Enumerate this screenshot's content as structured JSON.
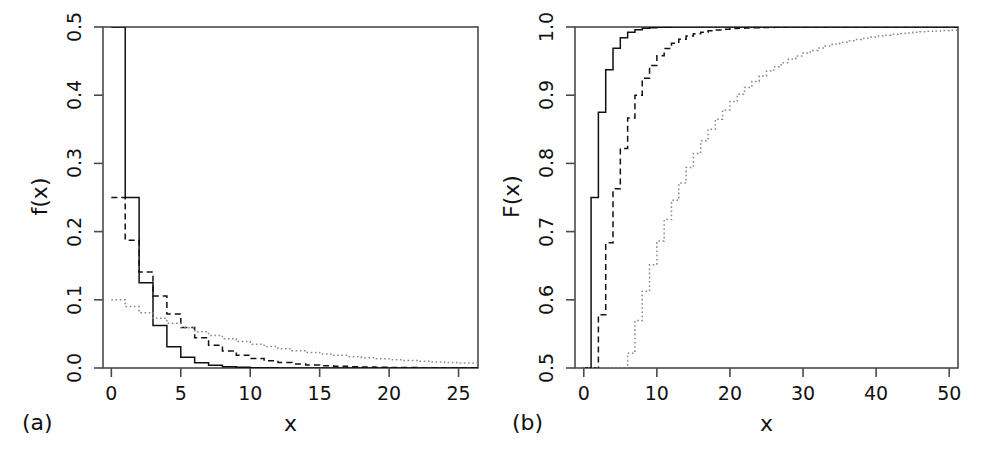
{
  "figure": {
    "background": "#ffffff",
    "ink": "#111111",
    "panels": [
      "a",
      "b"
    ]
  },
  "panel_a": {
    "tag": "(a)",
    "xlabel": "x",
    "ylabel": "f(x)",
    "xticks": [
      "0",
      "5",
      "10",
      "15",
      "20",
      "25"
    ],
    "yticks": [
      "0.0",
      "0.1",
      "0.2",
      "0.3",
      "0.4",
      "0.5"
    ]
  },
  "panel_b": {
    "tag": "(b)",
    "xlabel": "x",
    "ylabel": "F(x)",
    "xticks": [
      "0",
      "10",
      "20",
      "30",
      "40",
      "50"
    ],
    "yticks": [
      "0.5",
      "0.6",
      "0.7",
      "0.8",
      "0.9",
      "1.0"
    ]
  },
  "chart_data": [
    {
      "type": "line",
      "panel": "a",
      "title": "",
      "subtitle": "",
      "xlabel": "x",
      "ylabel": "f(x)",
      "xlim": [
        -0.5,
        26
      ],
      "ylim": [
        0.0,
        0.5
      ],
      "xticks": [
        0,
        5,
        10,
        15,
        20,
        25
      ],
      "yticks": [
        0.0,
        0.1,
        0.2,
        0.3,
        0.4,
        0.5
      ],
      "grid": false,
      "legend": "none",
      "step": "post",
      "note": "Geometric probability mass functions plotted as step curves",
      "x": [
        0,
        1,
        2,
        3,
        4,
        5,
        6,
        7,
        8,
        9,
        10,
        11,
        12,
        13,
        14,
        15,
        16,
        17,
        18,
        19,
        20,
        21,
        22,
        23,
        24,
        25
      ],
      "series": [
        {
          "name": "p = 0.5",
          "style": "solid",
          "color": "#111111",
          "values": [
            0.5,
            0.25,
            0.125,
            0.0625,
            0.03125,
            0.015625,
            0.0078125,
            0.00390625,
            0.001953,
            0.000977,
            0.000488,
            0.000244,
            0.000122,
            6.1e-05,
            3.05e-05,
            1.53e-05,
            7.6e-06,
            3.8e-06,
            1.9e-06,
            9.5e-07,
            4.8e-07,
            2.4e-07,
            1.2e-07,
            6e-08,
            3e-08,
            1.5e-08
          ]
        },
        {
          "name": "p = 0.25",
          "style": "dashed",
          "color": "#111111",
          "values": [
            0.25,
            0.1875,
            0.140625,
            0.105469,
            0.079102,
            0.059326,
            0.044495,
            0.033371,
            0.025028,
            0.018771,
            0.014078,
            0.010559,
            0.007919,
            0.005939,
            0.004455,
            0.003341,
            0.002506,
            0.001879,
            0.001409,
            0.001057,
            0.000793,
            0.000595,
            0.000446,
            0.000334,
            0.000251,
            0.000188
          ]
        },
        {
          "name": "p = 0.1",
          "style": "dotted",
          "color": "#8a8a8a",
          "values": [
            0.1,
            0.09,
            0.081,
            0.0729,
            0.06561,
            0.059049,
            0.053144,
            0.04783,
            0.043047,
            0.038742,
            0.034868,
            0.031381,
            0.028243,
            0.025419,
            0.022877,
            0.020589,
            0.01853,
            0.016677,
            0.015009,
            0.013509,
            0.012158,
            0.010942,
            0.009848,
            0.008863,
            0.007977,
            0.007179
          ]
        }
      ]
    },
    {
      "type": "line",
      "panel": "b",
      "title": "",
      "subtitle": "",
      "xlabel": "x",
      "ylabel": "F(x)",
      "xlim": [
        -1,
        51
      ],
      "ylim": [
        0.5,
        1.0
      ],
      "xticks": [
        0,
        10,
        20,
        30,
        40,
        50
      ],
      "yticks": [
        0.5,
        0.6,
        0.7,
        0.8,
        0.9,
        1.0
      ],
      "grid": false,
      "legend": "none",
      "step": "post",
      "note": "Geometric cumulative distribution functions plotted as step curves",
      "x": [
        0,
        1,
        2,
        3,
        4,
        5,
        6,
        7,
        8,
        9,
        10,
        11,
        12,
        13,
        14,
        15,
        16,
        17,
        18,
        19,
        20,
        21,
        22,
        23,
        24,
        25,
        26,
        27,
        28,
        29,
        30,
        31,
        32,
        33,
        34,
        35,
        36,
        37,
        38,
        39,
        40,
        41,
        42,
        43,
        44,
        45,
        46,
        47,
        48,
        49,
        50
      ],
      "series": [
        {
          "name": "p = 0.5",
          "style": "solid",
          "color": "#111111",
          "values": [
            0.5,
            0.75,
            0.875,
            0.9375,
            0.96875,
            0.984375,
            0.992188,
            0.996094,
            0.998047,
            0.999023,
            0.999512,
            0.999756,
            0.999878,
            0.999939,
            0.99997,
            0.999985,
            0.999992,
            0.999996,
            0.999998,
            0.999999,
            1,
            1,
            1,
            1,
            1,
            1,
            1,
            1,
            1,
            1,
            1,
            1,
            1,
            1,
            1,
            1,
            1,
            1,
            1,
            1,
            1,
            1,
            1,
            1,
            1,
            1,
            1,
            1,
            1,
            1,
            1
          ]
        },
        {
          "name": "p = 0.25",
          "style": "dashed",
          "color": "#111111",
          "values": [
            0.25,
            0.4375,
            0.578125,
            0.683594,
            0.762695,
            0.822021,
            0.866516,
            0.899887,
            0.924915,
            0.943686,
            0.957764,
            0.968323,
            0.976242,
            0.982182,
            0.986636,
            0.98998,
            0.992485,
            0.994364,
            0.995773,
            0.99683,
            0.997622,
            0.998217,
            0.998663,
            0.998997,
            0.999248,
            0.999436,
            0.999577,
            0.999683,
            0.999762,
            0.999822,
            0.999866,
            0.9999,
            0.999925,
            0.999944,
            0.999958,
            0.999968,
            0.999976,
            0.999982,
            0.999987,
            0.99999,
            0.999992,
            0.999994,
            0.999996,
            0.999997,
            0.999998,
            0.999998,
            0.999999,
            0.999999,
            0.999999,
            1,
            1
          ]
        },
        {
          "name": "p = 0.1",
          "style": "dotted",
          "color": "#8a8a8a",
          "values": [
            0.1,
            0.19,
            0.271,
            0.3439,
            0.40951,
            0.468559,
            0.521703,
            0.569533,
            0.61258,
            0.651322,
            0.68619,
            0.71757,
            0.745813,
            0.771232,
            0.794109,
            0.814698,
            0.833228,
            0.849905,
            0.864914,
            0.878423,
            0.890581,
            0.901523,
            0.911371,
            0.920234,
            0.92821,
            0.935389,
            0.94185,
            0.947665,
            0.952899,
            0.957609,
            0.961848,
            0.965663,
            0.969097,
            0.972187,
            0.974968,
            0.977472,
            0.979724,
            0.981752,
            0.983577,
            0.985219,
            0.986697,
            0.988027,
            0.989225,
            0.990302,
            0.991272,
            0.992145,
            0.99293,
            0.993637,
            0.994274,
            0.994846,
            0.995362
          ]
        }
      ]
    }
  ]
}
